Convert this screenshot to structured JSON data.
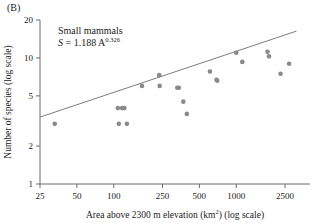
{
  "panel": {
    "label": "(B)"
  },
  "annotation": {
    "line1": "Small mammals",
    "equation_var": "S",
    "equation_eq": " = 1.188 A",
    "equation_exp": "0.326"
  },
  "axes": {
    "x": {
      "title": "Area above 2300 m elevation (km",
      "title_sup": "2",
      "title_tail": ") (log scale)",
      "ticks": [
        "25",
        "50",
        "100",
        "250",
        "500",
        "1000",
        "2500"
      ],
      "scale": "log",
      "min": 25,
      "max": 4000
    },
    "y": {
      "title": "Number of species (log scale)",
      "ticks": [
        "1",
        "2",
        "5",
        "10",
        "20"
      ],
      "scale": "log",
      "min": 1,
      "max": 20
    }
  },
  "colors": {
    "point": "#8a8a8a",
    "line": "#7d7d7d",
    "axis": "#6b6b6b",
    "text": "#1a1a1a",
    "background": "#ffffff"
  },
  "chart_data": {
    "type": "scatter",
    "title": "",
    "subtitle": "",
    "xlabel": "Area above 2300 m elevation (km2) (log scale)",
    "ylabel": "Number of species (log scale)",
    "xscale": "log",
    "yscale": "log",
    "xlim": [
      25,
      4000
    ],
    "ylim": [
      1,
      20
    ],
    "grid": false,
    "legend": false,
    "annotations": [
      "Small mammals",
      "S = 1.188 A^0.326"
    ],
    "series": [
      {
        "name": "Small mammals",
        "marker": "filled-circle",
        "color": "#8a8a8a",
        "points": [
          {
            "x": 33,
            "y": 3.0
          },
          {
            "x": 110,
            "y": 3.0
          },
          {
            "x": 128,
            "y": 3.0
          },
          {
            "x": 108,
            "y": 4.0
          },
          {
            "x": 117,
            "y": 4.0
          },
          {
            "x": 122,
            "y": 4.0
          },
          {
            "x": 170,
            "y": 6.0
          },
          {
            "x": 235,
            "y": 7.3
          },
          {
            "x": 237,
            "y": 6.0
          },
          {
            "x": 330,
            "y": 5.8
          },
          {
            "x": 340,
            "y": 5.8
          },
          {
            "x": 370,
            "y": 4.5
          },
          {
            "x": 395,
            "y": 3.6
          },
          {
            "x": 610,
            "y": 7.8
          },
          {
            "x": 690,
            "y": 6.7
          },
          {
            "x": 700,
            "y": 6.6
          },
          {
            "x": 1000,
            "y": 11.0
          },
          {
            "x": 1120,
            "y": 9.3
          },
          {
            "x": 1800,
            "y": 11.2
          },
          {
            "x": 1850,
            "y": 10.3
          },
          {
            "x": 2300,
            "y": 7.5
          },
          {
            "x": 2700,
            "y": 9.0
          }
        ]
      }
    ],
    "fit": {
      "name": "power-law regression",
      "equation": "S = 1.188 A^0.326",
      "coefficient": 1.188,
      "exponent": 0.326,
      "color": "#7d7d7d"
    }
  }
}
